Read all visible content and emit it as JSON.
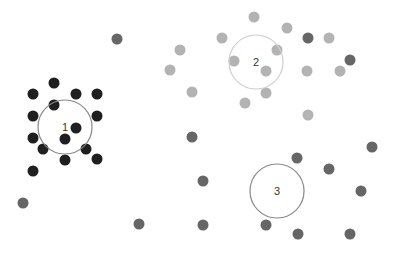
{
  "colors": {
    "background": "#ffffff",
    "cluster1_point": "#1f1f1f",
    "cluster2_point": "#b3b3b3",
    "cluster3_point": "#666666",
    "centroid_stroke": "#8a8a8a",
    "centroid2_stroke": "#cfcfcf",
    "label": "#333333"
  },
  "point_radius": 5.5,
  "centroids": [
    {
      "label": "1",
      "cx": 65,
      "cy": 127,
      "r": 27,
      "stroke": "#8a8a8a"
    },
    {
      "label": "2",
      "cx": 256,
      "cy": 62,
      "r": 27,
      "stroke": "#cfcfcf"
    },
    {
      "label": "3",
      "cx": 277,
      "cy": 191,
      "r": 27,
      "stroke": "#8a8a8a"
    }
  ],
  "clusters": [
    {
      "name": "cluster-1",
      "color": "#1f1f1f",
      "points": [
        [
          54,
          83
        ],
        [
          33,
          94
        ],
        [
          76,
          94
        ],
        [
          97,
          94
        ],
        [
          54,
          105
        ],
        [
          33,
          116
        ],
        [
          97,
          116
        ],
        [
          76,
          128
        ],
        [
          33,
          138
        ],
        [
          65,
          139
        ],
        [
          43,
          149
        ],
        [
          86,
          149
        ],
        [
          65,
          160
        ],
        [
          97,
          159
        ],
        [
          33,
          171
        ]
      ]
    },
    {
      "name": "cluster-2",
      "color": "#b3b3b3",
      "points": [
        [
          254,
          17
        ],
        [
          222,
          38
        ],
        [
          287,
          28
        ],
        [
          329,
          38
        ],
        [
          180,
          50
        ],
        [
          277,
          50
        ],
        [
          170,
          70
        ],
        [
          234,
          61
        ],
        [
          307,
          71
        ],
        [
          340,
          71
        ],
        [
          266,
          71
        ],
        [
          192,
          92
        ],
        [
          266,
          93
        ],
        [
          245,
          103
        ],
        [
          308,
          115
        ]
      ]
    },
    {
      "name": "cluster-3",
      "color": "#666666",
      "points": [
        [
          117,
          39
        ],
        [
          308,
          38
        ],
        [
          350,
          60
        ],
        [
          192,
          137
        ],
        [
          372,
          147
        ],
        [
          297,
          158
        ],
        [
          329,
          169
        ],
        [
          203,
          181
        ],
        [
          361,
          191
        ],
        [
          23,
          203
        ],
        [
          139,
          224
        ],
        [
          203,
          225
        ],
        [
          266,
          225
        ],
        [
          298,
          234
        ],
        [
          350,
          234
        ]
      ]
    }
  ]
}
